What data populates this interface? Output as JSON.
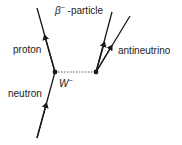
{
  "diagram": {
    "labels": {
      "beta_particle": "β⁻ -particle",
      "beta_symbol": "β",
      "beta_sup": "−",
      "beta_text": " -particle",
      "proton": "proton",
      "antineutrino": "antineutrino",
      "neutron": "neutron",
      "w_boson": "W",
      "w_sup": "−"
    },
    "vertices": [
      {
        "name": "left-vertex",
        "x": 55,
        "y": 72
      },
      {
        "name": "right-vertex",
        "x": 96,
        "y": 72
      }
    ],
    "lines": [
      {
        "name": "neutron-line",
        "from": [
          37,
          138
        ],
        "to": [
          55,
          72
        ],
        "style": "solid",
        "arrow": "forward"
      },
      {
        "name": "proton-line",
        "from": [
          55,
          72
        ],
        "to": [
          37,
          8
        ],
        "style": "solid",
        "arrow": "forward"
      },
      {
        "name": "w-boson-line",
        "from": [
          55,
          72
        ],
        "to": [
          96,
          72
        ],
        "style": "dotted",
        "arrow": "none"
      },
      {
        "name": "beta-particle-line",
        "from": [
          96,
          72
        ],
        "to": [
          112,
          12
        ],
        "style": "solid",
        "arrow": "forward"
      },
      {
        "name": "antineutrino-line",
        "from": [
          96,
          72
        ],
        "to": [
          130,
          16
        ],
        "style": "solid",
        "arrow": "forward"
      }
    ],
    "colors": {
      "line": "#1a1a1a",
      "text": "#222222",
      "background": "#ffffff"
    }
  }
}
